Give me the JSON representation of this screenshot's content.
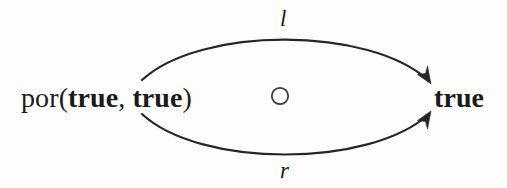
{
  "diagram": {
    "type": "parallel-arrows-commutative-diagram",
    "background_color": "#fdfdfc",
    "ink_color": "#1b1b1b",
    "source_node": {
      "function_name": "por",
      "open_paren": "(",
      "arg1": "true",
      "separator": ", ",
      "arg2": "true",
      "close_paren": ")"
    },
    "target_node": {
      "label": "true"
    },
    "edges": [
      {
        "name": "upper-edge",
        "label": "l",
        "direction": "source-to-target",
        "curvature": "arc-above",
        "arrowhead": "target-end"
      },
      {
        "name": "lower-edge",
        "label": "r",
        "direction": "source-to-target",
        "curvature": "arc-below",
        "arrowhead": "target-end"
      }
    ],
    "center_marker": {
      "glyph": "circle",
      "filled": false
    }
  }
}
